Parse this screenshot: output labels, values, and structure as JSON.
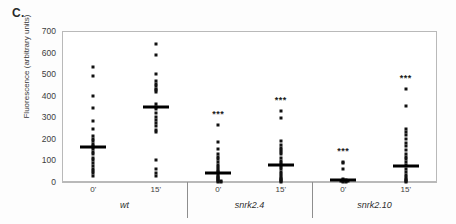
{
  "figure": {
    "panel_label": "C.",
    "ylabel": "Fluorescence (arbitrary units)"
  },
  "chart_data": {
    "type": "scatter",
    "title": "",
    "xlabel": "",
    "ylabel": "Fluorescence (arbitrary units)",
    "ylim": [
      0,
      700
    ],
    "yticks": [
      0,
      100,
      200,
      300,
      400,
      500,
      600,
      700
    ],
    "grid": false,
    "legend": null,
    "groups": [
      {
        "name": "wt",
        "label": "wt",
        "columns": [
          {
            "label": "0'",
            "mean": 160,
            "significance": "",
            "values": [
              535,
              492,
              398,
              343,
              283,
              247,
              215,
              200,
              190,
              178,
              168,
              160,
              152,
              140,
              128,
              112,
              100,
              88,
              74,
              62,
              50,
              42,
              30
            ]
          },
          {
            "label": "15'",
            "mean": 350,
            "significance": "",
            "values": [
              640,
              590,
              500,
              468,
              455,
              445,
              432,
              425,
              418,
              360,
              350,
              340,
              320,
              300,
              288,
              272,
              258,
              240,
              232,
              100,
              62,
              40,
              28
            ]
          }
        ]
      },
      {
        "name": "snrk2.4",
        "label": "snrk2.4",
        "columns": [
          {
            "label": "0'",
            "mean": 40,
            "significance": "***",
            "values": [
              262,
              185,
              152,
              130,
              118,
              105,
              92,
              80,
              70,
              60,
              52,
              45,
              38,
              30,
              24,
              18,
              12,
              8,
              5,
              3,
              2,
              1
            ]
          },
          {
            "label": "15'",
            "mean": 78,
            "significance": "***",
            "values": [
              328,
              295,
              192,
              172,
              158,
              148,
              138,
              128,
              112,
              98,
              88,
              78,
              68,
              58,
              48,
              38,
              28,
              20,
              14,
              9,
              5,
              2
            ]
          }
        ]
      },
      {
        "name": "snrk2.10",
        "label": "snrk2.10",
        "columns": [
          {
            "label": "0'",
            "mean": 8,
            "significance": "***",
            "values": [
              95,
              88,
              62,
              14,
              10,
              8,
              6,
              5,
              4,
              3,
              2,
              1
            ]
          },
          {
            "label": "15'",
            "mean": 75,
            "significance": "***",
            "values": [
              432,
              352,
              248,
              232,
              218,
              198,
              182,
              165,
              148,
              132,
              118,
              105,
              92,
              78,
              62,
              48,
              34,
              22,
              14,
              8,
              4,
              2
            ]
          }
        ]
      }
    ]
  }
}
